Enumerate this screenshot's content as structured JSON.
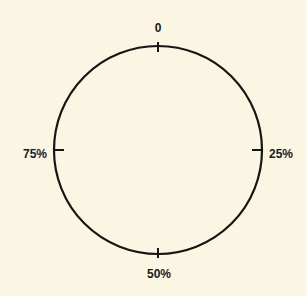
{
  "diagram": {
    "type": "circular-dial",
    "background": "#fbf6e4",
    "stroke_color": "#151515",
    "circle": {
      "cx": 158,
      "cy": 150,
      "r": 104
    },
    "ticks": [
      {
        "position": "top",
        "label": "0"
      },
      {
        "position": "right",
        "label": "25%"
      },
      {
        "position": "bottom",
        "label": "50%"
      },
      {
        "position": "left",
        "label": "75%"
      }
    ]
  }
}
